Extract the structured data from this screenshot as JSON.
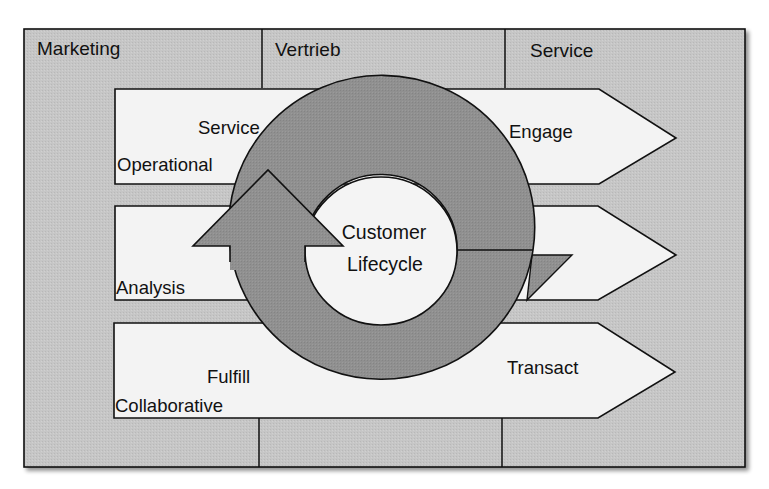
{
  "diagram": {
    "columns": [
      {
        "id": "marketing",
        "label": "Marketing"
      },
      {
        "id": "vertrieb",
        "label": "Vertrieb"
      },
      {
        "id": "service",
        "label": "Service"
      }
    ],
    "bands": [
      {
        "id": "operational",
        "category": "Operational",
        "phase": "Service",
        "right_label": "Engage"
      },
      {
        "id": "analysis",
        "category": "Analysis",
        "phase": "",
        "right_label": ""
      },
      {
        "id": "collaborative",
        "category": "Collaborative",
        "phase": "Fulfill",
        "right_label": "Transact"
      }
    ],
    "center": {
      "line1": "Customer",
      "line2": "Lifecycle"
    },
    "colors": {
      "frame_fill": "#c4c4c4",
      "band_fill": "#f2f2f2",
      "ring_fill": "#8f8f8f",
      "center_fill": "#f4f4f4",
      "stroke": "#111111"
    }
  }
}
